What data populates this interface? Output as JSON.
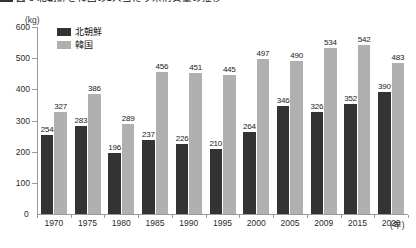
{
  "title_strip": {
    "text": "図 3   北朝鮮と韓国の1人当たり米消費量の推移"
  },
  "chart_data": {
    "type": "bar",
    "title": "",
    "xlabel": "年",
    "ylabel": "(kg)",
    "unit_label": "(kg)",
    "ylim": [
      0,
      600
    ],
    "yticks": [
      0,
      100,
      200,
      300,
      400,
      500,
      600
    ],
    "ytick_labels": [
      "0",
      "100",
      "200",
      "300",
      "400",
      "500",
      "600"
    ],
    "grid": false,
    "legend_position": "top-left",
    "categories": [
      "1970",
      "1975",
      "1980",
      "1985",
      "1990",
      "1995",
      "2000",
      "2005",
      "2009",
      "2015",
      "2020"
    ],
    "series": [
      {
        "name": "北朝鮮",
        "color": "#333333",
        "values": [
          254,
          283,
          196,
          237,
          226,
          210,
          264,
          346,
          326,
          352,
          390
        ]
      },
      {
        "name": "韓国",
        "color": "#b0b0b0",
        "values": [
          327,
          386,
          289,
          456,
          451,
          445,
          497,
          490,
          534,
          542,
          483
        ]
      }
    ]
  },
  "axis": {
    "zero_label": "0",
    "x_unit": "(年)"
  },
  "colors": {
    "north_korea": "#333333",
    "south_korea": "#b0b0b0",
    "axis": "#9a9a9a",
    "text": "#1a1a1a",
    "background": "#ffffff"
  }
}
